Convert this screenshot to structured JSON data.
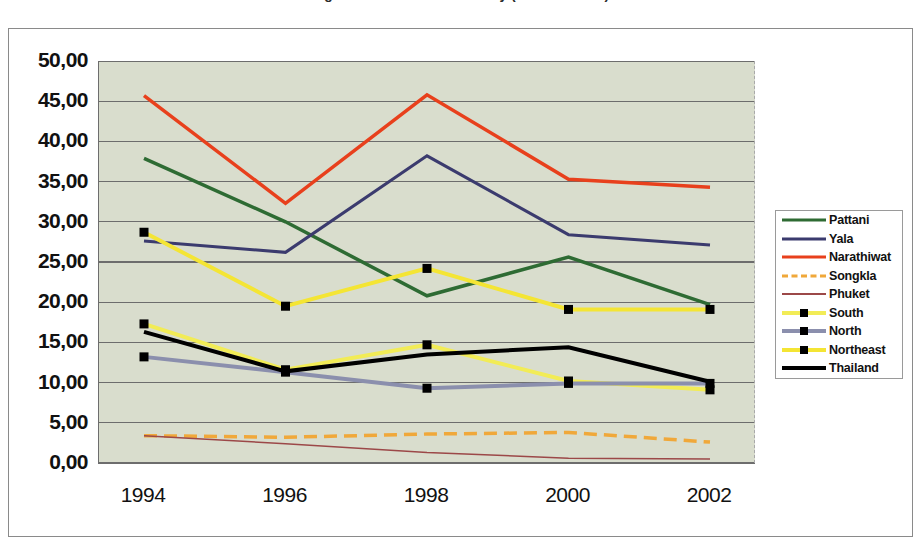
{
  "title": {
    "text": "Figure 5 Incidence of Poverty (% of Persons)",
    "cropped": true
  },
  "legend": {
    "position": "right",
    "entries": [
      {
        "label": "Pattani",
        "color": "#2e6b33",
        "style": "solid",
        "width": 3.5,
        "marker": "none"
      },
      {
        "label": "Yala",
        "color": "#3b3b6e",
        "style": "solid",
        "width": 3,
        "marker": "none"
      },
      {
        "label": "Narathiwat",
        "color": "#e8401c",
        "style": "solid",
        "width": 3.5,
        "marker": "none"
      },
      {
        "label": "Songkla",
        "color": "#f0a83a",
        "style": "dashed",
        "width": 3.5,
        "marker": "none"
      },
      {
        "label": "Phuket",
        "color": "#9c4848",
        "style": "solid",
        "width": 1.5,
        "marker": "none"
      },
      {
        "label": "South",
        "color": "#f2ec56",
        "style": "solid",
        "width": 4,
        "marker": "square"
      },
      {
        "label": "North",
        "color": "#8b8fad",
        "style": "solid",
        "width": 4,
        "marker": "square"
      },
      {
        "label": "Northeast",
        "color": "#f4e534",
        "style": "solid",
        "width": 4,
        "marker": "square"
      },
      {
        "label": "Thailand",
        "color": "#000000",
        "style": "solid",
        "width": 4,
        "marker": "none"
      }
    ]
  },
  "axes": {
    "y_tick_labels": [
      "50,00",
      "45,00",
      "40,00",
      "35,00",
      "30,00",
      "25,00",
      "20,00",
      "15,00",
      "10,00",
      "5,00",
      "0,00"
    ],
    "x_tick_labels": [
      "1994",
      "1996",
      "1998",
      "2000",
      "2002"
    ],
    "decimal_separator": ",",
    "grid": "horizontal"
  },
  "colors": {
    "plot_background": "#d9ddcd",
    "page_background": "#ffffff",
    "gridline": "#6d6d6d",
    "axis": "#6d6d6d",
    "frame_border": "#8a8a8a"
  },
  "chart_data": {
    "type": "line",
    "title": "Figure 5 Incidence of Poverty (% of Persons)",
    "xlabel": "",
    "ylabel": "",
    "x": [
      1994,
      1996,
      1998,
      2000,
      2002
    ],
    "categories": [
      "1994",
      "1996",
      "1998",
      "2000",
      "2002"
    ],
    "ylim": [
      0,
      50
    ],
    "ytick_step": 5,
    "grid": true,
    "legend_position": "right",
    "series": [
      {
        "name": "Pattani",
        "values": [
          37.9,
          30.0,
          20.8,
          25.6,
          19.7
        ]
      },
      {
        "name": "Yala",
        "values": [
          27.6,
          26.2,
          38.2,
          28.4,
          27.1
        ]
      },
      {
        "name": "Narathiwat",
        "values": [
          45.7,
          32.3,
          45.8,
          35.3,
          34.3
        ]
      },
      {
        "name": "Songkla",
        "values": [
          3.4,
          3.2,
          3.6,
          3.8,
          2.6
        ]
      },
      {
        "name": "Phuket",
        "values": [
          3.4,
          2.4,
          1.3,
          0.6,
          0.5
        ]
      },
      {
        "name": "South",
        "values": [
          17.3,
          11.6,
          14.7,
          10.2,
          9.1
        ]
      },
      {
        "name": "North",
        "values": [
          13.2,
          11.3,
          9.3,
          9.9,
          9.9
        ]
      },
      {
        "name": "Northeast",
        "values": [
          28.7,
          19.5,
          24.2,
          19.1,
          19.1
        ]
      },
      {
        "name": "Thailand",
        "values": [
          16.3,
          11.4,
          13.5,
          14.4,
          10.1
        ]
      }
    ]
  }
}
